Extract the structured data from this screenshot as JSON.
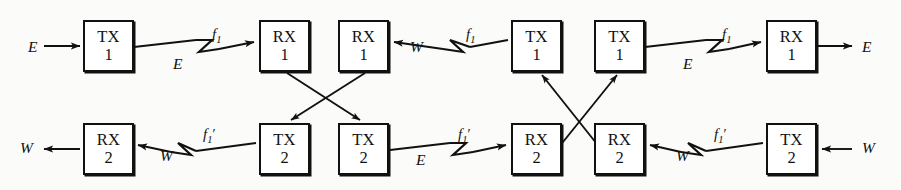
{
  "diagram": {
    "type": "block-diagram",
    "width": 901,
    "height": 190,
    "stroke_color": "#111111",
    "background_color": "#fbfbf9",
    "nodes": [
      {
        "id": "n1",
        "kind": "TX",
        "num": "1",
        "row": "top",
        "x": 83,
        "y": 20
      },
      {
        "id": "n2",
        "kind": "RX",
        "num": "1",
        "row": "top",
        "x": 259,
        "y": 20
      },
      {
        "id": "n3",
        "kind": "RX",
        "num": "1",
        "row": "top",
        "x": 338,
        "y": 20
      },
      {
        "id": "n4",
        "kind": "TX",
        "num": "1",
        "row": "top",
        "x": 511,
        "y": 20
      },
      {
        "id": "n5",
        "kind": "TX",
        "num": "1",
        "row": "top",
        "x": 594,
        "y": 20
      },
      {
        "id": "n6",
        "kind": "RX",
        "num": "1",
        "row": "top",
        "x": 766,
        "y": 20
      },
      {
        "id": "n7",
        "kind": "RX",
        "num": "2",
        "row": "bottom",
        "x": 83,
        "y": 123
      },
      {
        "id": "n8",
        "kind": "TX",
        "num": "2",
        "row": "bottom",
        "x": 259,
        "y": 123
      },
      {
        "id": "n9",
        "kind": "TX",
        "num": "2",
        "row": "bottom",
        "x": 338,
        "y": 123
      },
      {
        "id": "n10",
        "kind": "RX",
        "num": "2",
        "row": "bottom",
        "x": 511,
        "y": 123
      },
      {
        "id": "n11",
        "kind": "RX",
        "num": "2",
        "row": "bottom",
        "x": 594,
        "y": 123
      },
      {
        "id": "n12",
        "kind": "TX",
        "num": "2",
        "row": "bottom",
        "x": 766,
        "y": 123
      }
    ],
    "box_size": {
      "width": 51,
      "height": 52
    },
    "labels": [
      {
        "id": "l1",
        "text": "E",
        "type": "direction",
        "x": 28,
        "y": 39
      },
      {
        "id": "l2",
        "text": "E",
        "type": "direction",
        "x": 173,
        "y": 56
      },
      {
        "id": "l3",
        "text": "E",
        "type": "direction",
        "x": 683,
        "y": 56
      },
      {
        "id": "l4",
        "text": "E",
        "type": "direction",
        "x": 862,
        "y": 39
      },
      {
        "id": "l5",
        "text": "W",
        "type": "direction",
        "x": 410,
        "y": 39
      },
      {
        "id": "l6",
        "text": "W",
        "type": "direction",
        "x": 20,
        "y": 140
      },
      {
        "id": "l7",
        "text": "W",
        "type": "direction",
        "x": 160,
        "y": 148
      },
      {
        "id": "l8",
        "text": "E",
        "type": "direction",
        "x": 416,
        "y": 152
      },
      {
        "id": "l9",
        "text": "W",
        "type": "direction",
        "x": 676,
        "y": 148
      },
      {
        "id": "l10",
        "text": "W",
        "type": "direction",
        "x": 862,
        "y": 140
      }
    ],
    "frequency_labels": [
      {
        "id": "f1",
        "base": "f",
        "sub": "1",
        "prime": false,
        "x": 212,
        "y": 27
      },
      {
        "id": "f2",
        "base": "f",
        "sub": "1",
        "prime": false,
        "x": 466,
        "y": 27
      },
      {
        "id": "f3",
        "base": "f",
        "sub": "1",
        "prime": false,
        "x": 722,
        "y": 27
      },
      {
        "id": "f4",
        "base": "f",
        "sub": "1",
        "prime": true,
        "x": 203,
        "y": 127
      },
      {
        "id": "f5",
        "base": "f",
        "sub": "1",
        "prime": true,
        "x": 458,
        "y": 127
      },
      {
        "id": "f6",
        "base": "f",
        "sub": "1",
        "prime": true,
        "x": 714,
        "y": 127
      }
    ],
    "connections": [
      {
        "id": "c1",
        "kind": "arrow-in",
        "from": "edge-left",
        "to": "n1",
        "direction": "east"
      },
      {
        "id": "c2",
        "kind": "radio-link",
        "from": "n1",
        "to": "n2",
        "direction": "east",
        "freq": "f1"
      },
      {
        "id": "c3",
        "kind": "cross-down",
        "from": "n2",
        "to": "n9"
      },
      {
        "id": "c4",
        "kind": "cross-down",
        "from": "n3",
        "to": "n8"
      },
      {
        "id": "c5",
        "kind": "radio-link",
        "from": "n4",
        "to": "n3",
        "direction": "west",
        "freq": "f1"
      },
      {
        "id": "c6",
        "kind": "cross-up",
        "from": "n10",
        "to": "n5"
      },
      {
        "id": "c7",
        "kind": "cross-up",
        "from": "n11",
        "to": "n4"
      },
      {
        "id": "c8",
        "kind": "radio-link",
        "from": "n5",
        "to": "n6",
        "direction": "east",
        "freq": "f1"
      },
      {
        "id": "c9",
        "kind": "arrow-out",
        "from": "n6",
        "to": "edge-right",
        "direction": "east"
      },
      {
        "id": "c10",
        "kind": "arrow-out",
        "from": "n7",
        "to": "edge-left",
        "direction": "west"
      },
      {
        "id": "c11",
        "kind": "radio-link",
        "from": "n8",
        "to": "n7",
        "direction": "west",
        "freq": "f1prime"
      },
      {
        "id": "c12",
        "kind": "radio-link",
        "from": "n9",
        "to": "n10",
        "direction": "east",
        "freq": "f1prime"
      },
      {
        "id": "c13",
        "kind": "radio-link",
        "from": "n12",
        "to": "n11",
        "direction": "west",
        "freq": "f1prime"
      },
      {
        "id": "c14",
        "kind": "arrow-in",
        "from": "edge-right",
        "to": "n12",
        "direction": "west"
      }
    ]
  }
}
